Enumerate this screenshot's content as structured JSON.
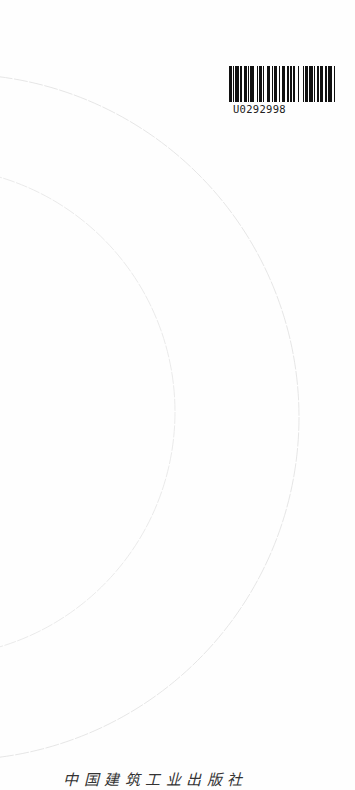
{
  "barcode": {
    "code": "U0292998",
    "bars": [
      2,
      1,
      1,
      1,
      3,
      1,
      1,
      2,
      2,
      1,
      1,
      1,
      3,
      2,
      1,
      1,
      2,
      1,
      1,
      2,
      3,
      1,
      1,
      1,
      2,
      2,
      1,
      1,
      3,
      1,
      2,
      1,
      1,
      1,
      2,
      2,
      1,
      3,
      1,
      1,
      2,
      1,
      3,
      1,
      1,
      1,
      2,
      1,
      2,
      2,
      1,
      1,
      3,
      2,
      1,
      1
    ]
  },
  "publisher": {
    "name": "中国建筑工业出版社"
  },
  "decoration": {
    "arc_color": "#e2e2e2",
    "outer_arc": {
      "cx": -44,
      "cy": 417,
      "r": 343
    },
    "inner_arc": {
      "cx": -70,
      "cy": 412,
      "r": 245
    }
  }
}
